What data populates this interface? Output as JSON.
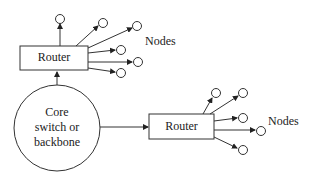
{
  "diagram": {
    "core": {
      "lines": [
        "Core",
        "switch or",
        "backbone"
      ]
    },
    "routers": [
      {
        "label": "Router",
        "nodes_label": "Nodes",
        "node_count": 6
      },
      {
        "label": "Router",
        "nodes_label": "Nodes",
        "node_count": 5
      }
    ]
  },
  "colors": {
    "stroke": "#333333",
    "text": "#222222",
    "background": "#ffffff"
  }
}
